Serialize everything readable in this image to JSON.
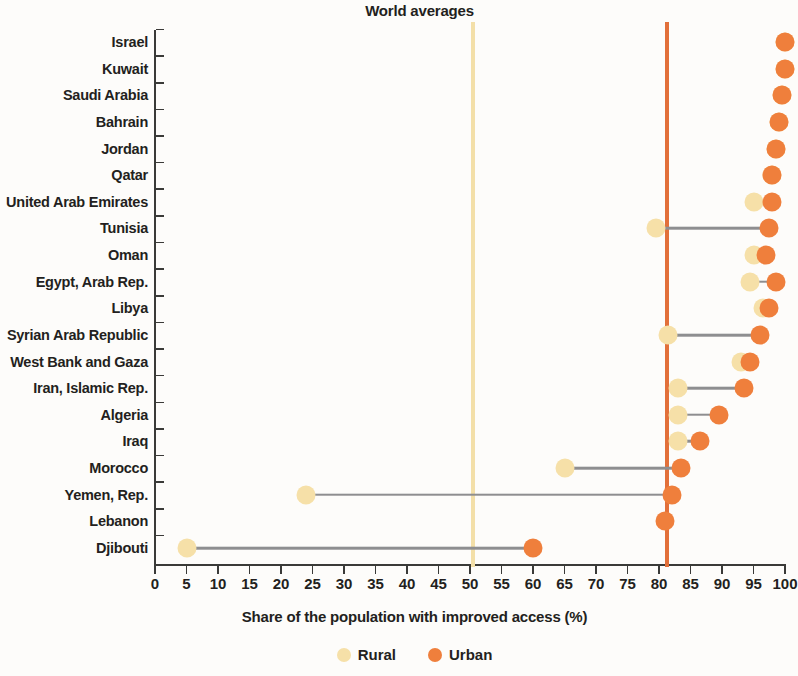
{
  "chart_data": {
    "type": "scatter",
    "subtype": "dumbbell-dot-plot",
    "title": "World averages",
    "xlabel": "Share of the population with improved access (%)",
    "ylabel": "",
    "xlim": [
      0,
      100
    ],
    "xticks": [
      0,
      5,
      10,
      15,
      20,
      25,
      30,
      35,
      40,
      45,
      50,
      55,
      60,
      65,
      70,
      75,
      80,
      85,
      90,
      95,
      100
    ],
    "grid": false,
    "legend_position": "bottom-center",
    "series": [
      {
        "name": "Rural",
        "color": "#f6e0a8"
      },
      {
        "name": "Urban",
        "color": "#ef7f3c"
      }
    ],
    "categories": [
      "Israel",
      "Kuwait",
      "Saudi Arabia",
      "Bahrain",
      "Jordan",
      "Qatar",
      "United Arab Emirates",
      "Tunisia",
      "Oman",
      "Egypt, Arab Rep.",
      "Libya",
      "Syrian Arab Republic",
      "West Bank and Gaza",
      "Iran, Islamic Rep.",
      "Algeria",
      "Iraq",
      "Morocco",
      "Yemen, Rep.",
      "Lebanon",
      "Djibouti"
    ],
    "rows": [
      {
        "category": "Israel",
        "rural": 100,
        "urban": 100
      },
      {
        "category": "Kuwait",
        "rural": 100,
        "urban": 100
      },
      {
        "category": "Saudi Arabia",
        "rural": 99.5,
        "urban": 99.5
      },
      {
        "category": "Bahrain",
        "rural": 99,
        "urban": 99
      },
      {
        "category": "Jordan",
        "rural": 98.5,
        "urban": 98.5
      },
      {
        "category": "Qatar",
        "rural": 98,
        "urban": 98
      },
      {
        "category": "United Arab Emirates",
        "rural": 95,
        "urban": 98
      },
      {
        "category": "Tunisia",
        "rural": 79.5,
        "urban": 97.5
      },
      {
        "category": "Oman",
        "rural": 95,
        "urban": 97
      },
      {
        "category": "Egypt, Arab Rep.",
        "rural": 94.5,
        "urban": 98.5
      },
      {
        "category": "Libya",
        "rural": 96.5,
        "urban": 97.5
      },
      {
        "category": "Syrian Arab Republic",
        "rural": 81.5,
        "urban": 96
      },
      {
        "category": "West Bank and Gaza",
        "rural": 93,
        "urban": 94.5
      },
      {
        "category": "Iran, Islamic Rep.",
        "rural": 83,
        "urban": 93.5
      },
      {
        "category": "Algeria",
        "rural": 83,
        "urban": 89.5
      },
      {
        "category": "Iraq",
        "rural": 83,
        "urban": 86.5
      },
      {
        "category": "Morocco",
        "rural": 65,
        "urban": 83.5
      },
      {
        "category": "Yemen, Rep.",
        "rural": 24,
        "urban": 82
      },
      {
        "category": "Lebanon",
        "rural": null,
        "urban": 81
      },
      {
        "category": "Djibouti",
        "rural": 5,
        "urban": 60
      }
    ],
    "reference_lines": [
      {
        "name": "Rural world average",
        "value": 50.5,
        "color": "#f3dfa8"
      },
      {
        "name": "Urban world average",
        "value": 81.3,
        "color": "#e2703a"
      }
    ],
    "annotations": [
      {
        "text": "World averages",
        "position": "top-center"
      }
    ]
  },
  "legend": {
    "items": [
      {
        "label": "Rural",
        "color": "#f6e0a8"
      },
      {
        "label": "Urban",
        "color": "#ef7f3c"
      }
    ]
  }
}
